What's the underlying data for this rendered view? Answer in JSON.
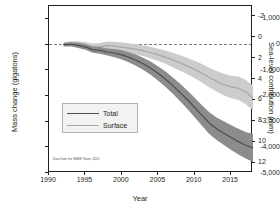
{
  "chart_data": {
    "type": "line",
    "title": "",
    "xlabel": "Year",
    "ylabel": "Mass change (gigatons)",
    "y2label": "Sea-level contribution (mm)",
    "xlim": [
      1990,
      2018
    ],
    "ylim": [
      -5000,
      1500
    ],
    "y2lim": [
      -3.0,
      13.0
    ],
    "grid": false,
    "legend_position": "center-left",
    "xticks": [
      1990,
      1995,
      2000,
      2005,
      2010,
      2015
    ],
    "xtick_labels": [
      "1990",
      "1995",
      "2000",
      "2005",
      "2010",
      "2015"
    ],
    "yticks": [
      1000,
      0,
      -1000,
      -2000,
      -3000,
      -4000,
      -5000
    ],
    "ytick_labels": [
      "1,000",
      "0",
      "-1,000",
      "-2,000",
      "-3,000",
      "-4,000",
      "-5,000"
    ],
    "y2ticks": [
      -2,
      0,
      2,
      4,
      6,
      8,
      10,
      12
    ],
    "y2tick_labels": [
      "-2",
      "0",
      "2",
      "4",
      "6",
      "8",
      "10",
      "12"
    ],
    "zero_line": 0,
    "annotation": "Data from the IMBIE Team, 2020",
    "x": [
      1992,
      1993,
      1994,
      1995,
      1996,
      1997,
      1998,
      1999,
      2000,
      2001,
      2002,
      2003,
      2004,
      2005,
      2006,
      2007,
      2008,
      2009,
      2010,
      2011,
      2012,
      2013,
      2014,
      2015,
      2016,
      2017,
      2018
    ],
    "series": [
      {
        "name": "Total",
        "color": "#4d4d4d",
        "band_color": "#8c8c8c",
        "values": [
          0,
          10,
          -30,
          -90,
          -200,
          -230,
          -290,
          -330,
          -400,
          -500,
          -620,
          -760,
          -930,
          -1130,
          -1350,
          -1600,
          -1870,
          -2150,
          -2450,
          -2760,
          -3060,
          -3280,
          -3450,
          -3620,
          -3780,
          -3920,
          -4020
        ],
        "band_lower": [
          -60,
          -70,
          -130,
          -200,
          -320,
          -360,
          -430,
          -490,
          -580,
          -700,
          -840,
          -1000,
          -1190,
          -1410,
          -1650,
          -1920,
          -2210,
          -2510,
          -2830,
          -3160,
          -3480,
          -3720,
          -3910,
          -4100,
          -4280,
          -4440,
          -4560
        ],
        "band_upper": [
          60,
          90,
          70,
          20,
          -80,
          -100,
          -150,
          -170,
          -220,
          -300,
          -400,
          -520,
          -670,
          -850,
          -1050,
          -1280,
          -1530,
          -1790,
          -2070,
          -2360,
          -2640,
          -2840,
          -2990,
          -3140,
          -3280,
          -3400,
          -3480
        ]
      },
      {
        "name": "Surface",
        "color": "#a6a6a6",
        "band_color": "#cccccc",
        "values": [
          0,
          20,
          10,
          -30,
          -100,
          -90,
          -40,
          -60,
          -100,
          -140,
          -190,
          -250,
          -320,
          -400,
          -490,
          -600,
          -720,
          -840,
          -970,
          -1120,
          -1280,
          -1430,
          -1560,
          -1650,
          -1700,
          -1850,
          -2080
        ],
        "band_lower": [
          -100,
          -90,
          -110,
          -160,
          -240,
          -240,
          -200,
          -230,
          -280,
          -330,
          -390,
          -460,
          -540,
          -640,
          -750,
          -880,
          -1020,
          -1160,
          -1310,
          -1480,
          -1660,
          -1830,
          -1980,
          -2090,
          -2160,
          -2320,
          -2560
        ],
        "band_upper": [
          100,
          130,
          130,
          100,
          40,
          60,
          120,
          110,
          80,
          50,
          10,
          -40,
          -100,
          -160,
          -230,
          -320,
          -420,
          -520,
          -630,
          -760,
          -900,
          -1030,
          -1140,
          -1210,
          -1240,
          -1380,
          -1600
        ]
      }
    ]
  },
  "axes": {
    "x_title": "Year",
    "y_title": "Mass change (gigatons)",
    "y2_title": "Sea-level contribution (mm)"
  },
  "legend": {
    "items": [
      {
        "label": "Total"
      },
      {
        "label": "Surface"
      }
    ]
  },
  "note": {
    "text": "Data from the IMBIE Team, 2020"
  }
}
